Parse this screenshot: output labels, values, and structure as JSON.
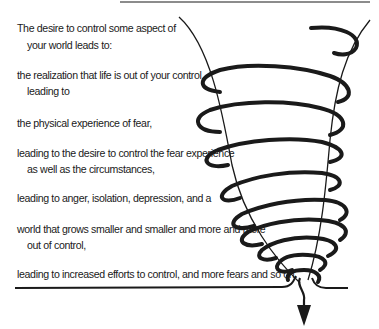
{
  "diagram": {
    "type": "spiral-cycle",
    "steps": [
      {
        "line1": "The desire to control some aspect of",
        "line2": "your world leads to:"
      },
      {
        "line1": "the realization that life is out of your control,",
        "line2": "leading to"
      },
      {
        "line1": "the physical experience of fear,"
      },
      {
        "line1": "leading to the desire to control the fear experience",
        "line2": "as well as the circumstances,"
      },
      {
        "line1": "leading to anger, isolation, depression, and a"
      },
      {
        "line1": "world that grows smaller and smaller and more and more",
        "line2": "out of control,"
      },
      {
        "line1": "leading to increased efforts to control, and more fears and so on."
      }
    ],
    "graphic": {
      "shape": "downward-narrowing spiral (tornado)",
      "coil_count": 9,
      "arrow_direction": "down",
      "stroke_color": "#1a1a1a"
    }
  }
}
